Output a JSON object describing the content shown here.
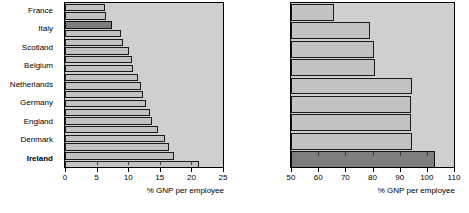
{
  "figure": {
    "accent_highlight": "#7d7d7d",
    "bar_fill": "#c2c2c2",
    "plot_background": "#cfcfcf"
  },
  "chart_data": [
    {
      "id": "left",
      "type": "bar",
      "orientation": "horizontal",
      "title": "",
      "xlabel": "% GNP per employee",
      "ylabel": "",
      "xlim": [
        0,
        25
      ],
      "xticks": [
        0,
        5,
        10,
        15,
        20,
        25
      ],
      "xtick_labels": [
        "0",
        "5",
        "10",
        "15",
        "20",
        "25"
      ],
      "grid": false,
      "legend": "none",
      "highlight_category": "Ireland",
      "categories": [
        "Turkey",
        "Spain",
        "Ireland",
        "Australia",
        "Japan",
        "France",
        "Belgium",
        "Germany",
        "Netherlands",
        "United States",
        "United Kingdom",
        "Portugal",
        "Austria",
        "Canada",
        "Finland",
        "Norway",
        "Denmark",
        "Switzerland",
        "Sweden"
      ],
      "values": [
        6.4,
        6.5,
        7.4,
        8.8,
        9.2,
        10.1,
        10.6,
        10.8,
        11.6,
        12.1,
        12.4,
        12.8,
        13.4,
        13.7,
        14.7,
        15.8,
        16.5,
        17.3,
        21.2
      ]
    },
    {
      "id": "right",
      "type": "bar",
      "orientation": "horizontal",
      "title": "",
      "xlabel": "% GNP per employee",
      "ylabel": "",
      "xlim": [
        50,
        110
      ],
      "xticks": [
        50,
        60,
        70,
        80,
        90,
        100,
        110
      ],
      "xtick_labels": [
        "50",
        "60",
        "70",
        "80",
        "90",
        "100",
        "110"
      ],
      "grid": false,
      "legend": "none",
      "highlight_category": "Ireland",
      "categories": [
        "France",
        "Italy",
        "Scotland",
        "Belgium",
        "Netherlands",
        "Germany",
        "England",
        "Denmark",
        "Ireland"
      ],
      "values": [
        66,
        79,
        80.5,
        81,
        94.5,
        94,
        94,
        94.5,
        103
      ]
    }
  ]
}
